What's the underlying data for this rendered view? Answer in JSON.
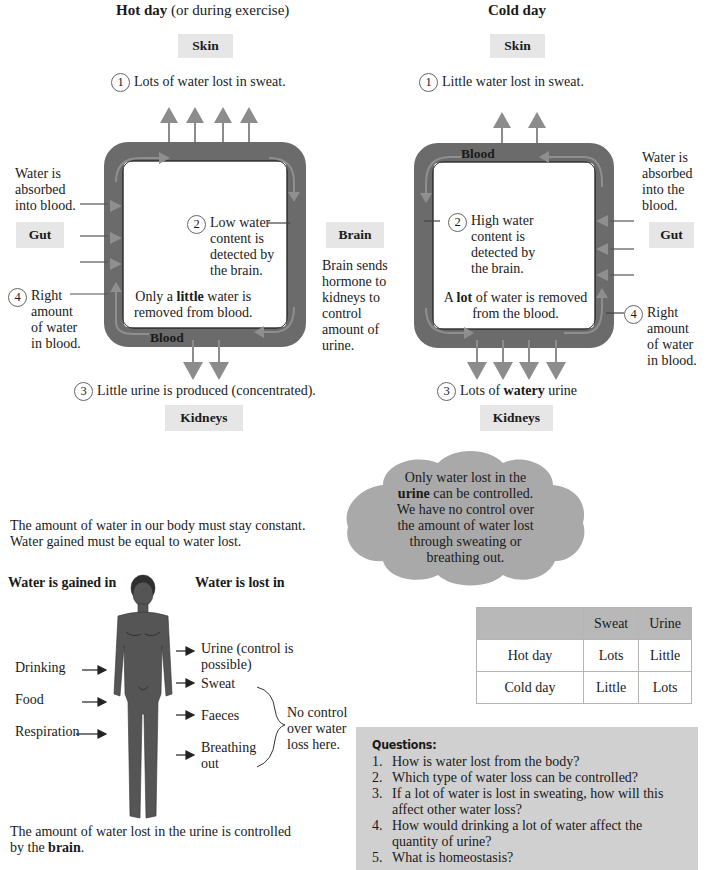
{
  "hot_day": {
    "title_bold": "Hot day",
    "title_rest": " (or during exercise)",
    "skin_label": "Skin",
    "step1": {
      "num": "1",
      "text": "Lots of water lost in sweat."
    },
    "gut_note": [
      "Water is",
      "absorbed",
      "into blood."
    ],
    "gut_label": "Gut",
    "step2": {
      "num": "2",
      "lines": [
        "Low water",
        "content is",
        "detected by",
        "the brain."
      ]
    },
    "removed": {
      "pre": "Only a ",
      "bold": "little",
      "post": " water is",
      "line2": "removed from blood."
    },
    "step4": {
      "num": "4",
      "lines": [
        "Right",
        "amount",
        "of water",
        "in blood."
      ]
    },
    "blood_label": "Blood",
    "step3": {
      "num": "3",
      "text": "Little urine is produced (concentrated)."
    },
    "kidneys_label": "Kidneys",
    "sweat_arrows": 4,
    "urine_arrows": 2
  },
  "brain": {
    "label": "Brain",
    "note": [
      "Brain sends",
      "hormone to",
      "kidneys to",
      "control",
      "amount of",
      "urine."
    ]
  },
  "cold_day": {
    "title": "Cold day",
    "skin_label": "Skin",
    "step1": {
      "num": "1",
      "text": "Little water lost in sweat."
    },
    "blood_label": "Blood",
    "gut_note": [
      "Water is",
      "absorbed",
      "into the",
      "blood."
    ],
    "gut_label": "Gut",
    "step2": {
      "num": "2",
      "lines": [
        "High water",
        "content is",
        "detected by",
        "the brain."
      ]
    },
    "removed": {
      "pre": "A ",
      "bold": "lot",
      "post": " of water is removed",
      "line2": "from the blood."
    },
    "step4": {
      "num": "4",
      "lines": [
        "Right",
        "amount",
        "of water",
        "in blood."
      ]
    },
    "step3": {
      "num": "3",
      "pre": "Lots of ",
      "bold": "watery",
      "post": " urine"
    },
    "kidneys_label": "Kidneys",
    "sweat_arrows": 2,
    "urine_arrows": 4
  },
  "cloud": {
    "line1": "Only water lost in the",
    "line2_bold": "urine",
    "line2_rest": " can be controlled.",
    "line3": "We have no control over",
    "line4": "the amount of water lost",
    "line5": "through sweating or",
    "line6": "breathing out."
  },
  "balance_text": [
    "The amount of water in our body must stay constant.",
    "Water gained must be equal to water lost."
  ],
  "body": {
    "gained_heading": "Water is gained in",
    "lost_heading": "Water is lost in",
    "gained": [
      "Drinking",
      "Food",
      "Respiration"
    ],
    "lost": [
      {
        "lines": [
          "Urine (control is",
          "possible)"
        ]
      },
      {
        "lines": [
          "Sweat"
        ]
      },
      {
        "lines": [
          "Faeces"
        ]
      },
      {
        "lines": [
          "Breathing",
          "out"
        ]
      }
    ],
    "no_control": [
      "No control",
      "over water",
      "loss here."
    ],
    "footer_pre": "The amount of water lost in the urine is controlled",
    "footer_line2_pre": "by the ",
    "footer_bold": "brain",
    "footer_end": "."
  },
  "table": {
    "headers": [
      "",
      "Sweat",
      "Urine"
    ],
    "rows": [
      [
        "Hot day",
        "Lots",
        "Little"
      ],
      [
        "Cold day",
        "Little",
        "Lots"
      ]
    ]
  },
  "questions": {
    "title": "Questions:",
    "items": [
      {
        "n": "1.",
        "lines": [
          "How is water lost from the body?"
        ]
      },
      {
        "n": "2.",
        "lines": [
          "Which type of water loss can be controlled?"
        ]
      },
      {
        "n": "3.",
        "lines": [
          "If a lot of water is lost in sweating, how will this",
          "affect other water loss?"
        ]
      },
      {
        "n": "4.",
        "lines": [
          "How would drinking a lot of water affect the",
          "quantity of urine?"
        ]
      },
      {
        "n": "5.",
        "lines": [
          "What is homeostasis?"
        ]
      }
    ]
  },
  "colors": {
    "blood_vessel": "#6b6b6b",
    "flow_arrow": "#8c8c8c",
    "label_box": "#e6e6e6",
    "cloud": "#a9a9a9",
    "questions_bg": "#d0d0d0",
    "table_header": "#b8b8b8"
  }
}
